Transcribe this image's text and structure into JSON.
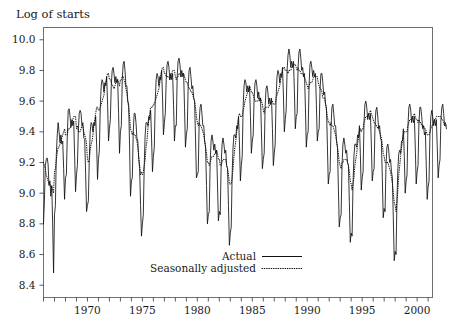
{
  "chart_data": {
    "type": "line",
    "title": "",
    "ylabel": "Log of starts",
    "xlabel": "",
    "ylim": [
      8.32,
      10.08
    ],
    "xlim": [
      1966.0,
      2001.4
    ],
    "yticks": [
      "8.4",
      "8.6",
      "8.8",
      "9.0",
      "9.2",
      "9.4",
      "9.6",
      "9.8",
      "10.0"
    ],
    "ytick_values": [
      8.4,
      8.6,
      8.8,
      9.0,
      9.2,
      9.4,
      9.6,
      9.8,
      10.0
    ],
    "xticks_labeled": [
      "1970",
      "1975",
      "1980",
      "1985",
      "1990",
      "1995",
      "2000"
    ],
    "xtick_label_values": [
      1970,
      1975,
      1980,
      1985,
      1990,
      1995,
      2000
    ],
    "xticks_minor_values": [
      1966,
      1967,
      1968,
      1969,
      1971,
      1972,
      1973,
      1974,
      1976,
      1977,
      1978,
      1979,
      1981,
      1982,
      1983,
      1984,
      1986,
      1987,
      1988,
      1989,
      1991,
      1992,
      1993,
      1994,
      1996,
      1997,
      1998,
      1999,
      2001
    ],
    "grid": false,
    "legend_position": "bottom-center",
    "x_start": 1966.0,
    "x_step": 0.08333333,
    "series": [
      {
        "name": "Actual",
        "style": "solid",
        "values": [
          8.8,
          8.95,
          9.18,
          9.22,
          9.23,
          9.19,
          9.05,
          9.08,
          8.98,
          9.05,
          8.8,
          8.48,
          8.86,
          8.92,
          9.25,
          9.38,
          9.46,
          9.4,
          9.33,
          9.38,
          9.32,
          9.34,
          9.16,
          8.96,
          9.1,
          9.12,
          9.38,
          9.54,
          9.55,
          9.5,
          9.43,
          9.48,
          9.44,
          9.47,
          9.24,
          9.01,
          9.12,
          9.18,
          9.4,
          9.52,
          9.54,
          9.52,
          9.44,
          9.46,
          9.36,
          9.35,
          9.13,
          8.88,
          8.92,
          8.95,
          9.22,
          9.4,
          9.46,
          9.45,
          9.4,
          9.46,
          9.44,
          9.5,
          9.32,
          9.09,
          9.22,
          9.28,
          9.56,
          9.7,
          9.74,
          9.72,
          9.66,
          9.72,
          9.7,
          9.76,
          9.58,
          9.34,
          9.42,
          9.48,
          9.7,
          9.8,
          9.82,
          9.78,
          9.72,
          9.76,
          9.72,
          9.74,
          9.52,
          9.26,
          9.4,
          9.44,
          9.74,
          9.84,
          9.86,
          9.8,
          9.7,
          9.7,
          9.6,
          9.58,
          9.3,
          8.98,
          9.08,
          9.1,
          9.4,
          9.52,
          9.52,
          9.46,
          9.36,
          9.34,
          9.22,
          9.16,
          8.92,
          8.72,
          8.8,
          8.86,
          9.18,
          9.38,
          9.46,
          9.46,
          9.44,
          9.5,
          9.48,
          9.54,
          9.36,
          9.14,
          9.24,
          9.3,
          9.6,
          9.74,
          9.78,
          9.76,
          9.7,
          9.76,
          9.74,
          9.8,
          9.62,
          9.38,
          9.46,
          9.52,
          9.74,
          9.84,
          9.86,
          9.82,
          9.74,
          9.78,
          9.74,
          9.78,
          9.58,
          9.34,
          9.44,
          9.44,
          9.76,
          9.86,
          9.88,
          9.84,
          9.76,
          9.8,
          9.76,
          9.78,
          9.56,
          9.3,
          9.38,
          9.42,
          9.7,
          9.8,
          9.82,
          9.76,
          9.68,
          9.7,
          9.62,
          9.6,
          9.36,
          9.1,
          9.12,
          9.14,
          9.46,
          9.56,
          9.58,
          9.52,
          9.44,
          9.44,
          9.34,
          9.3,
          9.05,
          8.8,
          8.86,
          8.88,
          9.2,
          9.34,
          9.38,
          9.34,
          9.28,
          9.32,
          9.26,
          9.28,
          9.06,
          8.82,
          8.88,
          8.86,
          9.18,
          9.32,
          9.36,
          9.32,
          9.26,
          9.28,
          9.18,
          9.16,
          8.92,
          8.66,
          8.74,
          8.78,
          9.12,
          9.3,
          9.38,
          9.38,
          9.36,
          9.44,
          9.42,
          9.5,
          9.32,
          9.08,
          9.18,
          9.24,
          9.56,
          9.7,
          9.74,
          9.72,
          9.66,
          9.7,
          9.66,
          9.7,
          9.5,
          9.26,
          9.34,
          9.38,
          9.62,
          9.72,
          9.74,
          9.7,
          9.62,
          9.66,
          9.6,
          9.62,
          9.4,
          9.16,
          9.22,
          9.26,
          9.56,
          9.68,
          9.7,
          9.66,
          9.58,
          9.62,
          9.58,
          9.62,
          9.42,
          9.18,
          9.26,
          9.32,
          9.62,
          9.76,
          9.8,
          9.78,
          9.72,
          9.78,
          9.76,
          9.82,
          9.64,
          9.4,
          9.48,
          9.54,
          9.8,
          9.9,
          9.94,
          9.9,
          9.82,
          9.86,
          9.82,
          9.86,
          9.66,
          9.42,
          9.5,
          9.52,
          9.82,
          9.92,
          9.94,
          9.88,
          9.8,
          9.82,
          9.76,
          9.78,
          9.56,
          9.3,
          9.38,
          9.4,
          9.7,
          9.84,
          9.86,
          9.82,
          9.76,
          9.8,
          9.76,
          9.78,
          9.58,
          9.34,
          9.4,
          9.42,
          9.68,
          9.78,
          9.78,
          9.72,
          9.64,
          9.66,
          9.58,
          9.56,
          9.32,
          9.06,
          9.12,
          9.14,
          9.44,
          9.56,
          9.58,
          9.52,
          9.44,
          9.44,
          9.34,
          9.3,
          9.04,
          8.78,
          8.84,
          8.86,
          9.18,
          9.32,
          9.36,
          9.32,
          9.26,
          9.28,
          9.2,
          9.18,
          8.94,
          8.68,
          8.74,
          8.72,
          9.06,
          9.24,
          9.32,
          9.32,
          9.3,
          9.38,
          9.36,
          9.44,
          9.26,
          9.02,
          9.1,
          9.14,
          9.46,
          9.58,
          9.6,
          9.56,
          9.48,
          9.52,
          9.48,
          9.52,
          9.32,
          9.08,
          9.14,
          9.16,
          9.44,
          9.54,
          9.56,
          9.5,
          9.42,
          9.44,
          9.36,
          9.34,
          9.1,
          8.84,
          8.9,
          8.88,
          9.18,
          9.3,
          9.32,
          9.28,
          9.2,
          9.22,
          9.14,
          9.1,
          8.84,
          8.56,
          8.62,
          8.6,
          8.96,
          9.16,
          9.26,
          9.28,
          9.26,
          9.34,
          9.34,
          9.42,
          9.24,
          9.0,
          9.08,
          9.12,
          9.44,
          9.56,
          9.58,
          9.54,
          9.46,
          9.5,
          9.46,
          9.5,
          9.3,
          9.06,
          9.14,
          9.18,
          9.46,
          9.56,
          9.56,
          9.5,
          9.42,
          9.44,
          9.38,
          9.4,
          9.18,
          8.96,
          9.04,
          9.08,
          9.38,
          9.5,
          9.54,
          9.5,
          9.44,
          9.48,
          9.44,
          9.48,
          9.3,
          9.1,
          9.18,
          9.22,
          9.48,
          9.56,
          9.58,
          9.52,
          9.44,
          9.46,
          9.42
        ]
      },
      {
        "name": "Seasonally adjusted",
        "style": "dotted",
        "values": [
          9.2,
          9.18,
          9.16,
          9.12,
          9.1,
          9.08,
          9.06,
          9.06,
          9.04,
          9.04,
          9.02,
          9.0,
          9.14,
          9.16,
          9.22,
          9.26,
          9.3,
          9.3,
          9.32,
          9.34,
          9.36,
          9.38,
          9.4,
          9.42,
          9.38,
          9.38,
          9.38,
          9.42,
          9.42,
          9.42,
          9.44,
          9.46,
          9.48,
          9.5,
          9.5,
          9.5,
          9.42,
          9.44,
          9.4,
          9.4,
          9.4,
          9.42,
          9.44,
          9.44,
          9.4,
          9.38,
          9.36,
          9.32,
          9.22,
          9.2,
          9.22,
          9.28,
          9.32,
          9.34,
          9.38,
          9.44,
          9.48,
          9.52,
          9.56,
          9.56,
          9.54,
          9.54,
          9.56,
          9.58,
          9.6,
          9.62,
          9.64,
          9.7,
          9.72,
          9.76,
          9.78,
          9.78,
          9.74,
          9.74,
          9.72,
          9.7,
          9.7,
          9.68,
          9.7,
          9.72,
          9.74,
          9.74,
          9.72,
          9.7,
          9.74,
          9.74,
          9.76,
          9.76,
          9.74,
          9.72,
          9.68,
          9.66,
          9.6,
          9.56,
          9.5,
          9.42,
          9.4,
          9.38,
          9.4,
          9.38,
          9.38,
          9.36,
          9.34,
          9.3,
          9.24,
          9.18,
          9.12,
          9.14,
          9.12,
          9.14,
          9.18,
          9.22,
          9.3,
          9.34,
          9.42,
          9.48,
          9.52,
          9.56,
          9.56,
          9.56,
          9.58,
          9.58,
          9.6,
          9.62,
          9.64,
          9.66,
          9.68,
          9.72,
          9.76,
          9.8,
          9.82,
          9.82,
          9.78,
          9.78,
          9.76,
          9.76,
          9.76,
          9.76,
          9.74,
          9.76,
          9.78,
          9.8,
          9.8,
          9.8,
          9.76,
          9.74,
          9.76,
          9.76,
          9.78,
          9.78,
          9.76,
          9.76,
          9.78,
          9.78,
          9.76,
          9.74,
          9.72,
          9.72,
          9.7,
          9.68,
          9.68,
          9.66,
          9.66,
          9.64,
          9.62,
          9.6,
          9.56,
          9.5,
          9.46,
          9.44,
          9.46,
          9.44,
          9.44,
          9.42,
          9.4,
          9.38,
          9.34,
          9.3,
          9.26,
          9.2,
          9.2,
          9.18,
          9.2,
          9.22,
          9.24,
          9.24,
          9.24,
          9.26,
          9.26,
          9.28,
          9.26,
          9.22,
          9.22,
          9.18,
          9.18,
          9.2,
          9.22,
          9.22,
          9.22,
          9.22,
          9.18,
          9.16,
          9.12,
          9.06,
          9.06,
          9.06,
          9.1,
          9.16,
          9.24,
          9.3,
          9.34,
          9.4,
          9.44,
          9.5,
          9.52,
          9.5,
          9.5,
          9.5,
          9.54,
          9.56,
          9.6,
          9.62,
          9.64,
          9.66,
          9.68,
          9.7,
          9.68,
          9.66,
          9.66,
          9.64,
          9.62,
          9.6,
          9.6,
          9.6,
          9.6,
          9.62,
          9.62,
          9.62,
          9.6,
          9.58,
          9.54,
          9.52,
          9.56,
          9.56,
          9.56,
          9.56,
          9.56,
          9.58,
          9.58,
          9.6,
          9.6,
          9.58,
          9.58,
          9.58,
          9.62,
          9.64,
          9.66,
          9.68,
          9.7,
          9.74,
          9.76,
          9.8,
          9.82,
          9.82,
          9.8,
          9.8,
          9.8,
          9.78,
          9.8,
          9.8,
          9.8,
          9.82,
          9.82,
          9.84,
          9.84,
          9.84,
          9.82,
          9.8,
          9.82,
          9.8,
          9.8,
          9.78,
          9.78,
          9.78,
          9.76,
          9.76,
          9.74,
          9.72,
          9.7,
          9.68,
          9.7,
          9.72,
          9.72,
          9.72,
          9.74,
          9.76,
          9.76,
          9.76,
          9.76,
          9.76,
          9.72,
          9.7,
          9.68,
          9.68,
          9.66,
          9.62,
          9.62,
          9.62,
          9.58,
          9.54,
          9.5,
          9.46,
          9.46,
          9.44,
          9.46,
          9.44,
          9.44,
          9.42,
          9.4,
          9.38,
          9.34,
          9.3,
          9.26,
          9.2,
          9.18,
          9.16,
          9.2,
          9.2,
          9.22,
          9.22,
          9.22,
          9.22,
          9.2,
          9.18,
          9.14,
          9.08,
          9.06,
          9.02,
          9.06,
          9.1,
          9.18,
          9.22,
          9.26,
          9.32,
          9.36,
          9.4,
          9.42,
          9.4,
          9.42,
          9.42,
          9.46,
          9.48,
          9.5,
          9.5,
          9.5,
          9.52,
          9.52,
          9.54,
          9.52,
          9.5,
          9.48,
          9.46,
          9.46,
          9.44,
          9.44,
          9.42,
          9.42,
          9.4,
          9.38,
          9.36,
          9.32,
          9.26,
          9.24,
          9.2,
          9.2,
          9.2,
          9.2,
          9.18,
          9.16,
          9.14,
          9.1,
          9.06,
          9.0,
          8.94,
          8.92,
          8.88,
          8.94,
          9.02,
          9.12,
          9.18,
          9.24,
          9.3,
          9.34,
          9.38,
          9.4,
          9.4,
          9.4,
          9.4,
          9.44,
          9.46,
          9.48,
          9.48,
          9.48,
          9.5,
          9.5,
          9.52,
          9.5,
          9.48,
          9.48,
          9.46,
          9.48,
          9.46,
          9.46,
          9.44,
          9.44,
          9.44,
          9.42,
          9.42,
          9.4,
          9.38,
          9.38,
          9.38,
          9.4,
          9.42,
          9.44,
          9.44,
          9.46,
          9.48,
          9.48,
          9.5,
          9.5,
          9.5,
          9.5,
          9.5,
          9.5,
          9.48,
          9.48,
          9.46,
          9.44,
          9.44,
          9.44
        ]
      }
    ]
  },
  "legend": {
    "items": [
      {
        "label": "Actual",
        "style": "solid"
      },
      {
        "label": "Seasonally adjusted",
        "style": "dotted"
      }
    ]
  },
  "axis": {
    "ylabel": "Log of starts"
  }
}
